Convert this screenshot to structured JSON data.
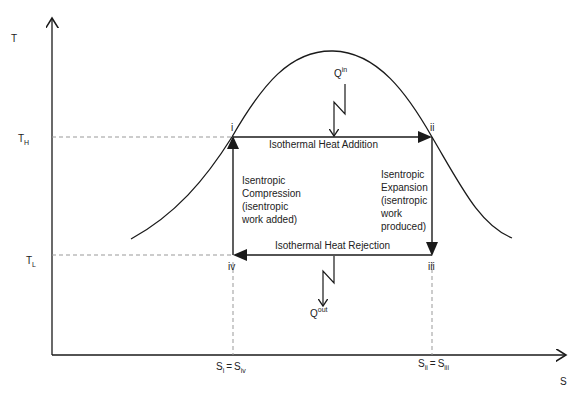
{
  "diagram": {
    "title": "",
    "axes": {
      "y_label": "T",
      "x_label": "S",
      "t_high": {
        "main": "T",
        "sub": "H"
      },
      "t_low": {
        "main": "T",
        "sub": "L"
      },
      "s_left": {
        "a_main": "S",
        "a_sub": "i",
        "eq": "=",
        "b_main": "S",
        "b_sub": "iv"
      },
      "s_right": {
        "a_main": "S",
        "a_sub": "ii",
        "eq": "=",
        "b_main": "S",
        "b_sub": "iii"
      }
    },
    "states": {
      "i": "i",
      "ii": "ii",
      "iii": "iii",
      "iv": "iv"
    },
    "processes": {
      "top": "Isothermal Heat Addition",
      "bottom": "Isothermal Heat Rejection",
      "left": [
        "Isentropic",
        "Compression",
        "(isentropic",
        "work added)"
      ],
      "right": [
        "Isentropic",
        "Expansion",
        "(isentropic",
        "work",
        "produced)"
      ]
    },
    "heat": {
      "q_in": {
        "main": "Q",
        "sup": "in"
      },
      "q_out": {
        "main": "Q",
        "sup": "out"
      }
    },
    "colors": {
      "line": "#1a1a1a",
      "dashed": "#999999",
      "text": "#222222"
    }
  }
}
